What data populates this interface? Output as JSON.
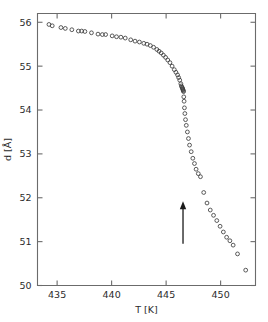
{
  "figure": {
    "name": "layer-spacing-vs-temperature-plot",
    "marker_style": "open-circle",
    "marker_color": "#3d3d3d",
    "axis_color": "#6b6b6b",
    "arrow_color": "#1a1a1a"
  },
  "chart_data": {
    "type": "scatter",
    "title": "",
    "xlabel": "T [K]",
    "ylabel": "d [Å]",
    "xlim": [
      433.2,
      453.2
    ],
    "ylim": [
      50.0,
      56.2
    ],
    "xticks": [
      435,
      440,
      445,
      450
    ],
    "xtick_labels": [
      "435",
      "440",
      "445",
      "450"
    ],
    "yticks": [
      50,
      51,
      52,
      53,
      54,
      55,
      56
    ],
    "ytick_labels": [
      "50",
      "51",
      "52",
      "53",
      "54",
      "55",
      "56"
    ],
    "grid": false,
    "legend": null,
    "annotations": [
      {
        "type": "arrow",
        "direction": "up",
        "x": 446.55,
        "y_base": 50.95,
        "y_tip": 51.9,
        "label": ""
      }
    ],
    "series": [
      {
        "name": "d",
        "marker": "open-circle",
        "x": [
          434.25,
          434.55,
          435.35,
          435.75,
          436.35,
          436.95,
          437.25,
          437.55,
          438.15,
          438.75,
          439.15,
          439.45,
          440.05,
          440.45,
          440.85,
          441.25,
          441.75,
          442.15,
          442.55,
          442.95,
          443.25,
          443.55,
          443.85,
          444.15,
          444.35,
          444.55,
          444.75,
          444.95,
          445.15,
          445.35,
          445.55,
          445.75,
          445.9,
          446.05,
          446.15,
          446.25,
          446.35,
          446.4,
          446.45,
          446.5,
          446.52,
          446.55,
          446.58,
          446.6,
          446.62,
          446.65,
          446.68,
          446.72,
          446.78,
          446.85,
          446.95,
          447.05,
          447.15,
          447.3,
          447.45,
          447.6,
          447.75,
          447.95,
          448.15,
          448.45,
          448.75,
          449.05,
          449.35,
          449.65,
          449.95,
          450.25,
          450.55,
          450.85,
          451.15,
          451.55,
          452.3
        ],
        "y": [
          55.95,
          55.92,
          55.88,
          55.86,
          55.83,
          55.8,
          55.8,
          55.79,
          55.76,
          55.73,
          55.72,
          55.72,
          55.69,
          55.67,
          55.66,
          55.64,
          55.6,
          55.57,
          55.55,
          55.52,
          55.5,
          55.47,
          55.43,
          55.38,
          55.34,
          55.3,
          55.25,
          55.2,
          55.14,
          55.08,
          55.0,
          54.92,
          54.86,
          54.8,
          54.74,
          54.68,
          54.6,
          54.55,
          54.52,
          54.5,
          54.48,
          54.46,
          54.44,
          54.42,
          54.3,
          54.2,
          54.05,
          53.92,
          53.78,
          53.65,
          53.5,
          53.35,
          53.2,
          53.05,
          52.9,
          52.78,
          52.65,
          52.55,
          52.48,
          52.12,
          51.88,
          51.72,
          51.6,
          51.48,
          51.35,
          51.22,
          51.1,
          51.02,
          50.92,
          50.72,
          50.35
        ]
      }
    ]
  }
}
